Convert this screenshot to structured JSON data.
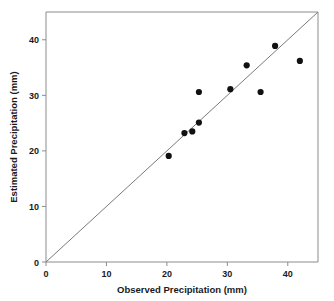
{
  "chart_data": {
    "type": "scatter",
    "title": "",
    "xlabel": "Observed Precipitation (mm)",
    "ylabel": "Estimated Precipitation (mm)",
    "xlim": [
      0,
      45
    ],
    "ylim": [
      0,
      45
    ],
    "xticks": [
      0,
      10,
      20,
      30,
      40
    ],
    "yticks": [
      0,
      10,
      20,
      30,
      40
    ],
    "xtick_labels": [
      "0",
      "10",
      "20",
      "30",
      "40"
    ],
    "ytick_labels": [
      "0",
      "10",
      "20",
      "30",
      "40"
    ],
    "grid": false,
    "legend": null,
    "series": [
      {
        "name": "Precipitation comparison",
        "marker": "filled-circle",
        "color": "#111111",
        "points": [
          {
            "x": 20.3,
            "y": 19.1
          },
          {
            "x": 22.9,
            "y": 23.2
          },
          {
            "x": 24.2,
            "y": 23.5
          },
          {
            "x": 25.3,
            "y": 25.1
          },
          {
            "x": 25.3,
            "y": 30.6
          },
          {
            "x": 30.5,
            "y": 31.1
          },
          {
            "x": 33.2,
            "y": 35.4
          },
          {
            "x": 35.5,
            "y": 30.6
          },
          {
            "x": 37.9,
            "y": 38.9
          },
          {
            "x": 42.0,
            "y": 36.2
          }
        ]
      }
    ],
    "reference_line": {
      "name": "one-to-one-line",
      "type": "identity",
      "from": {
        "x": 0,
        "y": 0
      },
      "to": {
        "x": 45,
        "y": 45
      },
      "color": "#7a7a7a"
    },
    "axis_color": "#8c8c8c",
    "background_color": "#ffffff"
  }
}
